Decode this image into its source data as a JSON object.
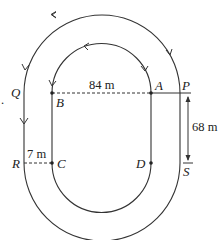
{
  "diagram": {
    "points": {
      "P": "P",
      "Q": "Q",
      "R": "R",
      "S": "S",
      "A": "A",
      "B": "B",
      "C": "C",
      "D": "D"
    },
    "measurements": {
      "straight_width": "84 m",
      "straight_length": "68 m",
      "lane_gap": "7 m"
    },
    "margin_mark": ".",
    "colors": {
      "stroke": "#333333",
      "text": "#222222",
      "background": "#ffffff"
    }
  }
}
